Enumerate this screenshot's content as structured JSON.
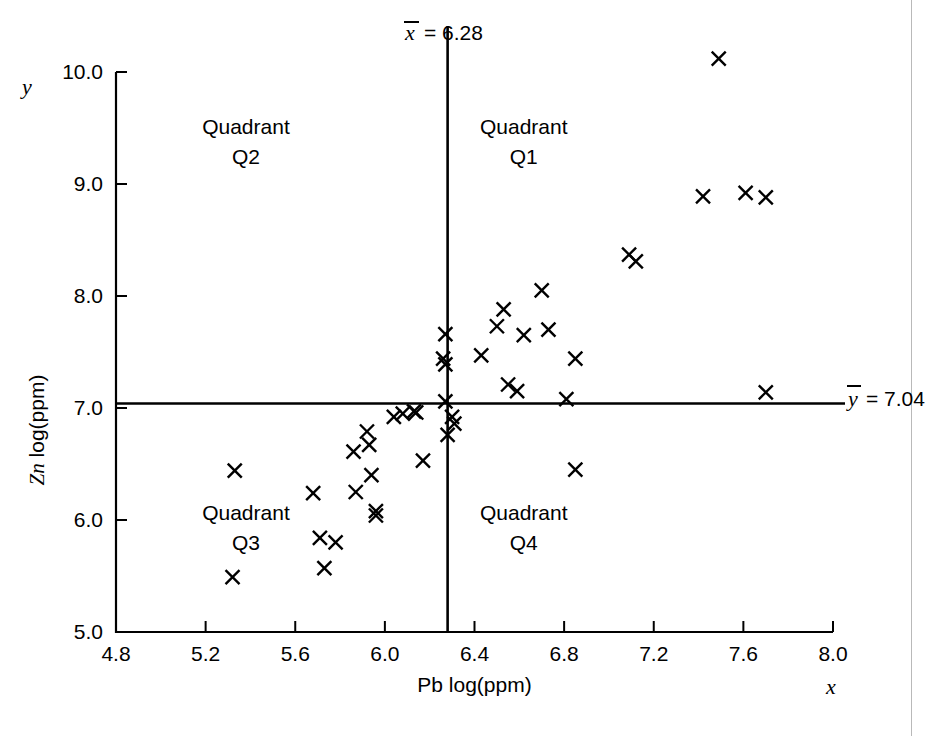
{
  "chart_data": {
    "type": "scatter",
    "title": "",
    "xlabel": "Pb log(ppm)",
    "ylabel": "Zn log(ppm)",
    "x_axis_variable": "x",
    "y_axis_variable": "y",
    "xlim": [
      4.8,
      8.0
    ],
    "ylim": [
      5.0,
      10.0
    ],
    "xticks": [
      "4.8",
      "5.2",
      "5.6",
      "6.0",
      "6.4",
      "6.8",
      "7.2",
      "7.6",
      "8.0"
    ],
    "xtick_values": [
      4.8,
      5.2,
      5.6,
      6.0,
      6.4,
      6.8,
      7.2,
      7.6,
      8.0
    ],
    "yticks": [
      "5.0",
      "6.0",
      "7.0",
      "8.0",
      "9.0",
      "10.0"
    ],
    "ytick_values": [
      5.0,
      6.0,
      7.0,
      8.0,
      9.0,
      10.0
    ],
    "grid": false,
    "legend": "none",
    "marker": "x",
    "marker_color": "#000000",
    "reference_lines": [
      {
        "id": "x-mean",
        "orientation": "vertical",
        "value": 6.28,
        "label": "x̄ = 6.28",
        "label_symbol": "x",
        "label_text": "= 6.28"
      },
      {
        "id": "y-mean",
        "orientation": "horizontal",
        "value": 7.04,
        "label": "ȳ = 7.04",
        "label_symbol": "y",
        "label_text": "= 7.04"
      }
    ],
    "annotations": [
      {
        "id": "q1",
        "line1": "Quadrant",
        "line2": "Q1",
        "x": 6.62,
        "y": 9.45
      },
      {
        "id": "q2",
        "line1": "Quadrant",
        "line2": "Q2",
        "x": 5.38,
        "y": 9.45
      },
      {
        "id": "q3",
        "line1": "Quadrant",
        "line2": "Q3",
        "x": 5.38,
        "y": 6.0
      },
      {
        "id": "q4",
        "line1": "Quadrant",
        "line2": "Q4",
        "x": 6.62,
        "y": 6.0
      }
    ],
    "points": [
      [
        5.33,
        6.44
      ],
      [
        5.32,
        5.49
      ],
      [
        5.68,
        6.24
      ],
      [
        5.71,
        5.84
      ],
      [
        5.73,
        5.57
      ],
      [
        5.78,
        5.8
      ],
      [
        5.86,
        6.61
      ],
      [
        5.87,
        6.25
      ],
      [
        5.92,
        6.79
      ],
      [
        5.93,
        6.67
      ],
      [
        5.94,
        6.4
      ],
      [
        5.96,
        6.08
      ],
      [
        5.96,
        6.04
      ],
      [
        6.04,
        6.92
      ],
      [
        6.08,
        6.95
      ],
      [
        6.13,
        6.97
      ],
      [
        6.14,
        6.96
      ],
      [
        6.17,
        6.53
      ],
      [
        6.27,
        7.66
      ],
      [
        6.26,
        7.44
      ],
      [
        6.27,
        7.39
      ],
      [
        6.27,
        7.06
      ],
      [
        6.3,
        6.92
      ],
      [
        6.31,
        6.86
      ],
      [
        6.28,
        6.76
      ],
      [
        6.43,
        7.47
      ],
      [
        6.5,
        7.73
      ],
      [
        6.53,
        7.88
      ],
      [
        6.55,
        7.21
      ],
      [
        6.59,
        7.15
      ],
      [
        6.62,
        7.65
      ],
      [
        6.7,
        8.05
      ],
      [
        6.73,
        7.7
      ],
      [
        6.81,
        7.08
      ],
      [
        6.85,
        7.44
      ],
      [
        6.85,
        6.45
      ],
      [
        7.09,
        8.37
      ],
      [
        7.12,
        8.31
      ],
      [
        7.42,
        8.89
      ],
      [
        7.49,
        10.12
      ],
      [
        7.61,
        8.92
      ],
      [
        7.7,
        8.88
      ],
      [
        7.7,
        7.14
      ]
    ],
    "point_count": 43
  }
}
